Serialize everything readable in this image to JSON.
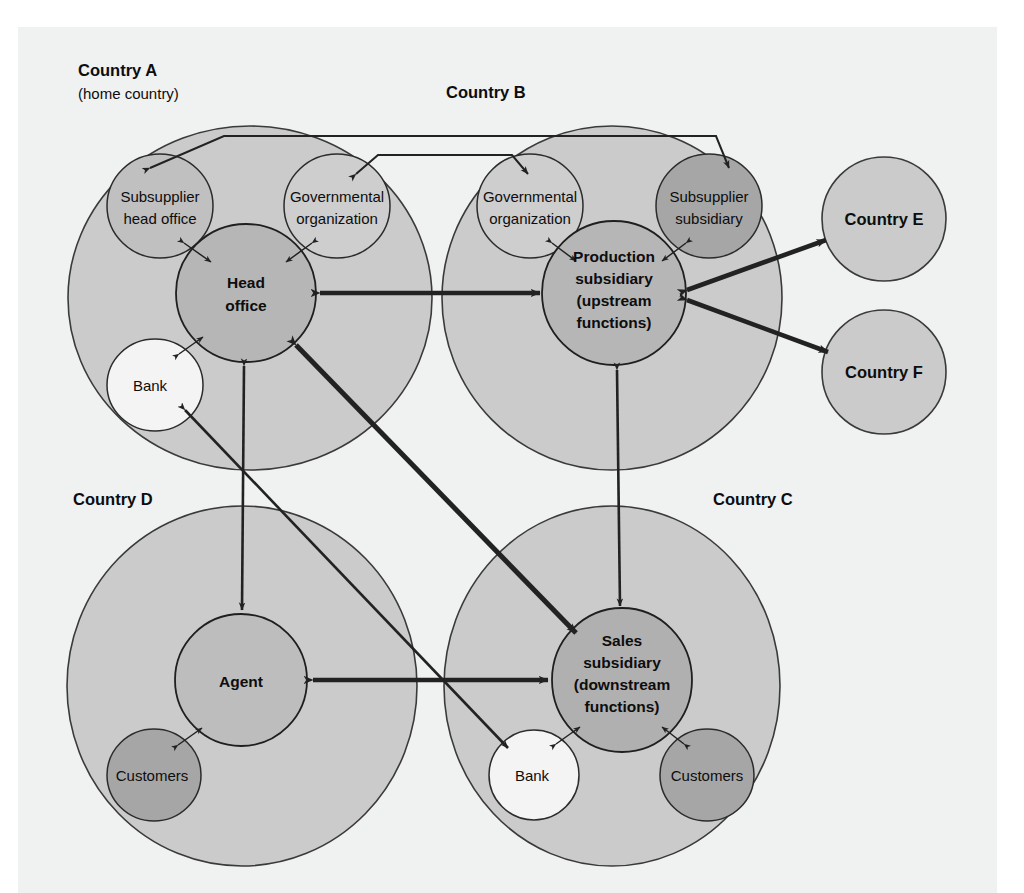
{
  "figure": {
    "caption": "Figure 3.3   An example of an international network"
  },
  "colors": {
    "page_background": "#ffffff",
    "frame_background": "#f0f1f1",
    "country_fill": "#cccccc",
    "country_stroke": "#333333",
    "node_fill": "#b5b5b5",
    "node_stroke": "#222222",
    "satellite_light_fill": "#f2f2f2",
    "satellite_dark_fill": "#a8a8a8",
    "arrow_color": "#222222"
  },
  "countries": [
    {
      "id": "A",
      "label": "Country A",
      "sublabel": "(home country)"
    },
    {
      "id": "B",
      "label": "Country B",
      "sublabel": ""
    },
    {
      "id": "C",
      "label": "Country C",
      "sublabel": ""
    },
    {
      "id": "D",
      "label": "Country D",
      "sublabel": ""
    },
    {
      "id": "E",
      "label": "Country E",
      "sublabel": ""
    },
    {
      "id": "F",
      "label": "Country F",
      "sublabel": ""
    }
  ],
  "nodes": {
    "head_office": {
      "lines": [
        "Head",
        "office"
      ],
      "country": "A",
      "style": "bold"
    },
    "subsupplier_head_office": {
      "lines": [
        "Subsupplier",
        "head office"
      ],
      "country": "A",
      "style": "plain"
    },
    "gov_org_a": {
      "lines": [
        "Governmental",
        "organization"
      ],
      "country": "A",
      "style": "plain"
    },
    "bank_a": {
      "lines": [
        "Bank"
      ],
      "country": "A",
      "style": "plain"
    },
    "production_subsidiary": {
      "lines": [
        "Production",
        "subsidiary",
        "(upstream",
        "functions)"
      ],
      "country": "B",
      "style": "bold"
    },
    "gov_org_b": {
      "lines": [
        "Governmental",
        "organization"
      ],
      "country": "B",
      "style": "plain"
    },
    "subsupplier_subsidiary": {
      "lines": [
        "Subsupplier",
        "subsidiary"
      ],
      "country": "B",
      "style": "plain"
    },
    "sales_subsidiary": {
      "lines": [
        "Sales",
        "subsidiary",
        "(downstream",
        "functions)"
      ],
      "country": "C",
      "style": "bold"
    },
    "bank_c": {
      "lines": [
        "Bank"
      ],
      "country": "C",
      "style": "plain"
    },
    "customers_c": {
      "lines": [
        "Customers"
      ],
      "country": "C",
      "style": "plain"
    },
    "agent": {
      "lines": [
        "Agent"
      ],
      "country": "D",
      "style": "bold"
    },
    "customers_d": {
      "lines": [
        "Customers"
      ],
      "country": "D",
      "style": "plain"
    },
    "country_e": {
      "lines": [
        "Country E"
      ],
      "country": "E",
      "style": "bold"
    },
    "country_f": {
      "lines": [
        "Country F"
      ],
      "country": "F",
      "style": "bold"
    }
  },
  "connections": [
    {
      "from": "head_office",
      "to": "production_subsidiary",
      "arrows": "both",
      "weight": "thick"
    },
    {
      "from": "head_office",
      "to": "sales_subsidiary",
      "arrows": "both",
      "weight": "thick"
    },
    {
      "from": "head_office",
      "to": "agent",
      "arrows": "both",
      "weight": "thin"
    },
    {
      "from": "bank_a",
      "to": "bank_c",
      "arrows": "both",
      "weight": "thin"
    },
    {
      "from": "agent",
      "to": "sales_subsidiary",
      "arrows": "both",
      "weight": "thick"
    },
    {
      "from": "production_subsidiary",
      "to": "sales_subsidiary",
      "arrows": "both",
      "weight": "thin"
    },
    {
      "from": "production_subsidiary",
      "to": "country_e",
      "arrows": "both",
      "weight": "thick"
    },
    {
      "from": "production_subsidiary",
      "to": "country_f",
      "arrows": "both",
      "weight": "thick"
    },
    {
      "from": "subsupplier_head_office",
      "to": "subsupplier_subsidiary",
      "arrows": "both",
      "weight": "thin"
    },
    {
      "from": "gov_org_a",
      "to": "gov_org_b",
      "arrows": "both",
      "weight": "thin"
    },
    {
      "from": "subsupplier_head_office",
      "to": "head_office",
      "arrows": "both",
      "weight": "thin"
    },
    {
      "from": "gov_org_a",
      "to": "head_office",
      "arrows": "both",
      "weight": "thin"
    },
    {
      "from": "bank_a",
      "to": "head_office",
      "arrows": "both",
      "weight": "thin"
    },
    {
      "from": "gov_org_b",
      "to": "production_subsidiary",
      "arrows": "both",
      "weight": "thin"
    },
    {
      "from": "subsupplier_subsidiary",
      "to": "production_subsidiary",
      "arrows": "both",
      "weight": "thin"
    },
    {
      "from": "bank_c",
      "to": "sales_subsidiary",
      "arrows": "both",
      "weight": "thin"
    },
    {
      "from": "customers_c",
      "to": "sales_subsidiary",
      "arrows": "both",
      "weight": "thin"
    },
    {
      "from": "customers_d",
      "to": "agent",
      "arrows": "both",
      "weight": "thin"
    }
  ]
}
